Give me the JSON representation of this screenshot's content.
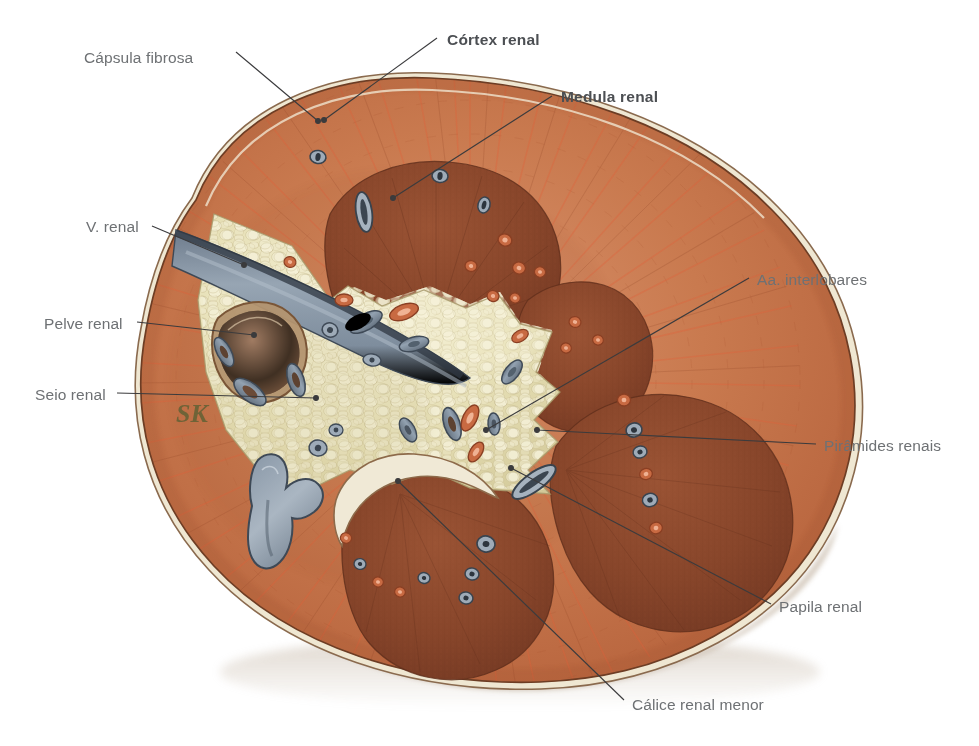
{
  "figure": {
    "kind": "anatomical-illustration",
    "language": "pt-BR",
    "background_color": "#ffffff",
    "signature": "SK"
  },
  "palette": {
    "background": "#ffffff",
    "label_text": "#6e7174",
    "label_text_bold": "#4c4f53",
    "leader_line": "#3b3b3d",
    "capsule": "#e9e2cf",
    "capsule_edge": "#7d5a46",
    "cortex_base": "#c06a43",
    "cortex_light": "#d98a5c",
    "cortex_streak": "#e2603a",
    "medulla_base": "#8e462c",
    "medulla_dark": "#713venue",
    "medulla_shadow": "#6d3venue",
    "sinus_fat": "#e3ddb4",
    "sinus_fat_light": "#f2eed4",
    "sinus_fat_shade": "#c9c091",
    "vein_blue": "#8897a8",
    "vein_blue_dark": "#53606f",
    "artery_orange": "#c9663f",
    "pelvis_brown": "#9d6e5a",
    "calyx_blue": "#7f8da0",
    "drop_shadow": "#c7b9a6"
  },
  "labels": [
    {
      "id": "capsula-fibrosa",
      "text": "Cápsula fibrosa",
      "bold": false,
      "align": "left",
      "x": 84,
      "y": 50,
      "anchor_x": 236,
      "anchor_y": 52,
      "target_x": 318,
      "target_y": 121
    },
    {
      "id": "cortex-renal",
      "text": "Córtex renal",
      "bold": true,
      "align": "left",
      "x": 447,
      "y": 32,
      "anchor_x": 437,
      "anchor_y": 38,
      "target_x": 324,
      "target_y": 120
    },
    {
      "id": "medula-renal",
      "text": "Medula renal",
      "bold": true,
      "align": "left",
      "x": 561,
      "y": 89,
      "anchor_x": 552,
      "anchor_y": 96,
      "target_x": 393,
      "target_y": 198
    },
    {
      "id": "v-renal",
      "text": "V. renal",
      "bold": false,
      "align": "left",
      "x": 86,
      "y": 219,
      "anchor_x": 152,
      "anchor_y": 226,
      "target_x": 244,
      "target_y": 265
    },
    {
      "id": "pelve-renal",
      "text": "Pelve renal",
      "bold": false,
      "align": "left",
      "x": 44,
      "y": 316,
      "anchor_x": 137,
      "anchor_y": 322,
      "target_x": 254,
      "target_y": 335
    },
    {
      "id": "seio-renal",
      "text": "Seio renal",
      "bold": false,
      "align": "left",
      "x": 35,
      "y": 387,
      "anchor_x": 117,
      "anchor_y": 393,
      "target_x": 316,
      "target_y": 398
    },
    {
      "id": "aa-interlobares",
      "text": "Aa. interlobares",
      "bold": false,
      "align": "left",
      "x": 757,
      "y": 272,
      "anchor_x": 749,
      "anchor_y": 278,
      "target_x": 486,
      "target_y": 430
    },
    {
      "id": "piramides-renais",
      "text": "Pirâmides renais",
      "bold": false,
      "align": "left",
      "x": 824,
      "y": 438,
      "anchor_x": 816,
      "anchor_y": 444,
      "target_x": 537,
      "target_y": 430
    },
    {
      "id": "papila-renal",
      "text": "Papila renal",
      "bold": false,
      "align": "left",
      "x": 779,
      "y": 599,
      "anchor_x": 771,
      "anchor_y": 604,
      "target_x": 511,
      "target_y": 468
    },
    {
      "id": "calice-renal-menor",
      "text": "Cálice renal menor",
      "bold": false,
      "align": "left",
      "x": 632,
      "y": 697,
      "anchor_x": 624,
      "anchor_y": 700,
      "target_x": 398,
      "target_y": 481
    }
  ],
  "structures": [
    {
      "id": "fibrous-capsule",
      "name": "Cápsula fibrosa"
    },
    {
      "id": "renal-cortex",
      "name": "Córtex renal"
    },
    {
      "id": "renal-medulla",
      "name": "Medula renal"
    },
    {
      "id": "renal-vein",
      "name": "V. renal"
    },
    {
      "id": "renal-pelvis",
      "name": "Pelve renal"
    },
    {
      "id": "renal-sinus",
      "name": "Seio renal"
    },
    {
      "id": "interlobar-arteries",
      "name": "Aa. interlobares"
    },
    {
      "id": "renal-pyramids",
      "name": "Pirâmides renais"
    },
    {
      "id": "renal-papilla",
      "name": "Papila renal"
    },
    {
      "id": "minor-calyx",
      "name": "Cálice renal menor"
    }
  ]
}
